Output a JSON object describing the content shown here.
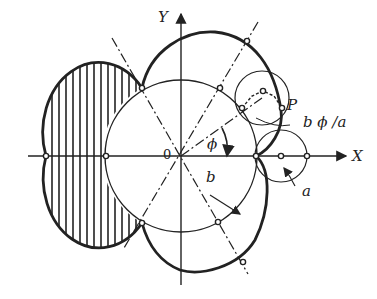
{
  "diagram": {
    "type": "epicycloid-construction",
    "labels": {
      "y_axis": "Y",
      "x_axis": "X",
      "origin": "0",
      "point": "P",
      "arc_length": "b ϕ /a",
      "angle": "ϕ",
      "big_radius": "b",
      "small_radius": "a"
    },
    "colors": {
      "ink": "#222222",
      "background": "#ffffff"
    }
  }
}
